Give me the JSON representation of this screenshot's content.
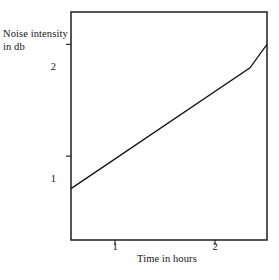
{
  "chart_data": {
    "type": "line",
    "title": "",
    "subtitle": "",
    "xlabel": "Time in hours",
    "ylabel": "Noise intensity in db",
    "ylabel_line1": "Noise intensity",
    "ylabel_line2": "in db",
    "xticks": [
      "1",
      "2"
    ],
    "xtick_values": [
      1,
      2
    ],
    "yticks": [
      "1",
      "2"
    ],
    "ytick_values": [
      1,
      2
    ],
    "xlim": [
      0.56,
      2.52
    ],
    "ylim": [
      0.25,
      2.29
    ],
    "grid": false,
    "legend": false,
    "series": [
      {
        "name": "Noise intensity",
        "x": [
          0.56,
          2.35,
          2.52
        ],
        "y": [
          0.71,
          1.79,
          2.0
        ],
        "color": "#111111",
        "linewidth": 1.3
      }
    ],
    "annotations": []
  },
  "axes": {
    "frame_color": "#2b2b2b",
    "background": "#ffffff"
  }
}
